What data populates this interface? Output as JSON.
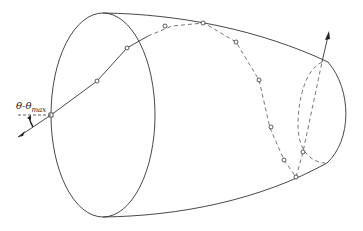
{
  "diagram": {
    "type": "ray-tracing-concentrator",
    "labels": {
      "angle_theta": "θ",
      "angle_sep": "-",
      "angle_theta2": "θ",
      "angle_subscript": "max"
    },
    "colors": {
      "stroke": "#333333",
      "background": "#ffffff"
    },
    "ray_points": [
      [
        51,
        115
      ],
      [
        97,
        81
      ],
      [
        127,
        48
      ],
      [
        172,
        26
      ],
      [
        204,
        23
      ],
      [
        236,
        42
      ],
      [
        259,
        80
      ],
      [
        270,
        128
      ],
      [
        284,
        160
      ],
      [
        296,
        177
      ],
      [
        303,
        152
      ]
    ]
  }
}
